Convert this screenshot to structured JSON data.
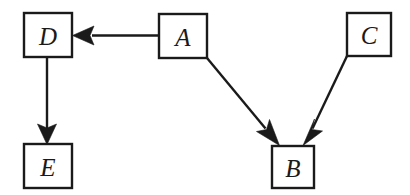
{
  "diagram": {
    "background_color": "#ffffff",
    "stroke_color": "#1a1a1a",
    "node_fill_color": "#ffffff",
    "nodes": [
      {
        "id": "D",
        "label": "D",
        "x": 24,
        "y": 13,
        "width": 48,
        "height": 44
      },
      {
        "id": "A",
        "label": "A",
        "x": 159,
        "y": 14,
        "width": 48,
        "height": 44
      },
      {
        "id": "C",
        "label": "C",
        "x": 347,
        "y": 13,
        "width": 44,
        "height": 43
      },
      {
        "id": "E",
        "label": "E",
        "x": 24,
        "y": 144,
        "width": 48,
        "height": 44
      },
      {
        "id": "B",
        "label": "B",
        "x": 272,
        "y": 146,
        "width": 42,
        "height": 42
      }
    ],
    "edges": [
      {
        "from": "A",
        "to": "D",
        "direction": "left",
        "arrowhead": "filled-triangle"
      },
      {
        "from": "D",
        "to": "E",
        "direction": "down",
        "arrowhead": "filled-triangle"
      },
      {
        "from": "A",
        "to": "B",
        "direction": "down-right",
        "arrowhead": "filled-triangle"
      },
      {
        "from": "C",
        "to": "B",
        "direction": "down-left",
        "arrowhead": "filled-triangle"
      }
    ]
  }
}
